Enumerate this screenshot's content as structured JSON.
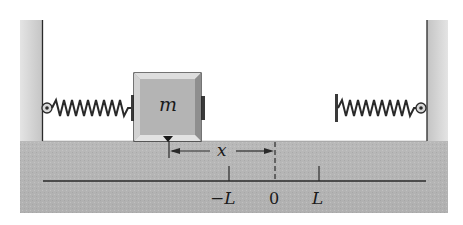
{
  "diagram": {
    "type": "mass-spring system",
    "mass_label": "m",
    "displacement_label": "x",
    "axis": {
      "ticks": [
        {
          "label": "−L",
          "position": "-L"
        },
        {
          "label": "0",
          "position": "0"
        },
        {
          "label": "L",
          "position": "L"
        }
      ]
    },
    "components": [
      "left-wall",
      "right-wall",
      "floor",
      "left-spring",
      "right-spring",
      "block"
    ],
    "colors": {
      "wall_fill": "#c9c9c9",
      "floor_fill": "#b5b5b5",
      "block_fill": "#b0b0b0",
      "line": "#2a2a2a"
    }
  }
}
